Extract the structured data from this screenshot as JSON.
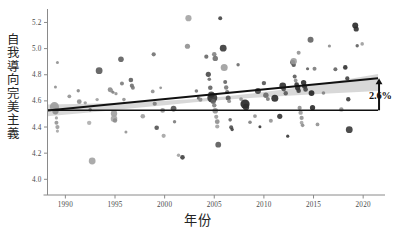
{
  "chart_data": {
    "type": "scatter",
    "title": "",
    "subtitle": "",
    "xlabel": "年份",
    "ylabel": "自我導向完美主義",
    "xlim": [
      1988.2,
      2022.2
    ],
    "ylim": [
      3.88,
      5.28
    ],
    "xticks": [
      1990,
      1995,
      2000,
      2005,
      2010,
      2015,
      2020
    ],
    "xticklabels": [
      "1990",
      "1995",
      "2000",
      "2005",
      "2010",
      "2015",
      "2020"
    ],
    "yticks": [
      4.0,
      4.2,
      4.4,
      4.6,
      4.8,
      5.0,
      5.2
    ],
    "yticklabels": [
      "4.0",
      "4.2",
      "4.4",
      "4.6",
      "4.8",
      "5.0",
      "5.2"
    ],
    "grid": false,
    "legend": null,
    "legend_position": "none",
    "annotations": [
      {
        "name": "change-annotation",
        "text": "2.6%",
        "x": 2021.6,
        "y_from": 4.528,
        "y_to": 4.773,
        "arrow": "up"
      }
    ],
    "reference_line": {
      "name": "baseline-1989",
      "type": "horizontal",
      "y": 4.528,
      "x_start": 1988.2,
      "x_end": 2021.5,
      "color": "#111111"
    },
    "trend_line": {
      "name": "linear-regression",
      "color": "#111111",
      "x_start": 1988.2,
      "x_end": 2021.5,
      "y_start": 4.527,
      "y_end": 4.773,
      "slope_per_year": 0.00739,
      "total_change_pct": 2.6
    },
    "confidence_band": {
      "name": "95-percent-ci",
      "color": "#c9c9c9",
      "opacity": 0.72,
      "x": [
        1988.2,
        1991,
        1994,
        1997,
        2000,
        2003,
        2006,
        2009,
        2012,
        2015,
        2018,
        2021.5
      ],
      "lower": [
        4.483,
        4.502,
        4.523,
        4.545,
        4.567,
        4.589,
        4.608,
        4.624,
        4.637,
        4.65,
        4.662,
        4.676
      ],
      "upper": [
        4.572,
        4.576,
        4.582,
        4.59,
        4.601,
        4.615,
        4.634,
        4.658,
        4.688,
        4.722,
        4.76,
        4.806
      ]
    },
    "point_style": {
      "marker": "circle",
      "size_range_px": [
        1.3,
        5.4
      ],
      "color_light": "#b4b4b4",
      "color_mid": "#6e6e6e",
      "color_dark": "#1f1f1f",
      "size_encodes": "sample-size",
      "color_encodes": "sample-weight"
    },
    "points": [
      {
        "x": 1989.2,
        "y": 4.893,
        "r": 1.5,
        "c": "#8c8c8c"
      },
      {
        "x": 1989.0,
        "y": 4.706,
        "r": 1.5,
        "c": "#8c8c8c"
      },
      {
        "x": 1988.9,
        "y": 4.556,
        "r": 4.6,
        "c": "#9a9a9a"
      },
      {
        "x": 1989.0,
        "y": 4.52,
        "r": 3.1,
        "c": "#8a8a8a"
      },
      {
        "x": 1989.1,
        "y": 4.47,
        "r": 1.6,
        "c": "#9c9c9c"
      },
      {
        "x": 1989.1,
        "y": 4.432,
        "r": 2.0,
        "c": "#8f8f8f"
      },
      {
        "x": 1989.2,
        "y": 4.4,
        "r": 2.1,
        "c": "#9a9a9a"
      },
      {
        "x": 1989.2,
        "y": 4.369,
        "r": 1.6,
        "c": "#a4a4a4"
      },
      {
        "x": 1990.4,
        "y": 4.635,
        "r": 1.9,
        "c": "#909090"
      },
      {
        "x": 1991.3,
        "y": 4.677,
        "r": 1.7,
        "c": "#848484"
      },
      {
        "x": 1991.4,
        "y": 4.594,
        "r": 2.4,
        "c": "#8b8b8b"
      },
      {
        "x": 1992.0,
        "y": 4.585,
        "r": 1.7,
        "c": "#979797"
      },
      {
        "x": 1992.5,
        "y": 4.532,
        "r": 1.8,
        "c": "#6f6f6f"
      },
      {
        "x": 1992.4,
        "y": 4.432,
        "r": 2.2,
        "c": "#ababab"
      },
      {
        "x": 1992.7,
        "y": 4.14,
        "r": 3.4,
        "c": "#9f9f9f"
      },
      {
        "x": 1993.4,
        "y": 4.831,
        "r": 3.4,
        "c": "#555555"
      },
      {
        "x": 1993.2,
        "y": 4.61,
        "r": 1.7,
        "c": "#9b9b9b"
      },
      {
        "x": 1994.5,
        "y": 4.686,
        "r": 2.4,
        "c": "#888888"
      },
      {
        "x": 1994.6,
        "y": 4.68,
        "r": 2.1,
        "c": "#959595"
      },
      {
        "x": 1994.8,
        "y": 4.666,
        "r": 1.6,
        "c": "#7b7b7b"
      },
      {
        "x": 1995.1,
        "y": 4.655,
        "r": 1.6,
        "c": "#8e8e8e"
      },
      {
        "x": 1994.9,
        "y": 4.503,
        "r": 3.2,
        "c": "#9d9d9d"
      },
      {
        "x": 1994.9,
        "y": 4.463,
        "r": 3.3,
        "c": "#a3a3a3"
      },
      {
        "x": 1995.0,
        "y": 4.45,
        "r": 2.2,
        "c": "#8b8b8b"
      },
      {
        "x": 1995.6,
        "y": 4.918,
        "r": 2.8,
        "c": "#5b5b5b"
      },
      {
        "x": 1995.7,
        "y": 4.733,
        "r": 2.0,
        "c": "#787878"
      },
      {
        "x": 1995.9,
        "y": 4.61,
        "r": 1.8,
        "c": "#8e8e8e"
      },
      {
        "x": 1996.1,
        "y": 4.362,
        "r": 1.5,
        "c": "#909090"
      },
      {
        "x": 1996.6,
        "y": 4.76,
        "r": 2.3,
        "c": "#5a5a5a"
      },
      {
        "x": 1996.7,
        "y": 4.716,
        "r": 2.1,
        "c": "#6c6c6c"
      },
      {
        "x": 1996.8,
        "y": 4.7,
        "r": 2.0,
        "c": "#747474"
      },
      {
        "x": 1997.8,
        "y": 4.483,
        "r": 2.3,
        "c": "#9b9b9b"
      },
      {
        "x": 1998.9,
        "y": 4.956,
        "r": 2.1,
        "c": "#6d6d6d"
      },
      {
        "x": 1998.8,
        "y": 4.672,
        "r": 1.9,
        "c": "#8b8b8b"
      },
      {
        "x": 1999.0,
        "y": 4.578,
        "r": 2.1,
        "c": "#797979"
      },
      {
        "x": 1999.2,
        "y": 4.395,
        "r": 2.3,
        "c": "#4e4e4e"
      },
      {
        "x": 1999.6,
        "y": 4.7,
        "r": 1.4,
        "c": "#8d8d8d"
      },
      {
        "x": 1999.8,
        "y": 4.527,
        "r": 2.4,
        "c": "#929292"
      },
      {
        "x": 1999.9,
        "y": 4.333,
        "r": 2.1,
        "c": "#a2a2a2"
      },
      {
        "x": 2000.9,
        "y": 4.541,
        "r": 2.9,
        "c": "#4d4d4d"
      },
      {
        "x": 2001.0,
        "y": 4.44,
        "r": 1.7,
        "c": "#787878"
      },
      {
        "x": 2001.4,
        "y": 4.184,
        "r": 1.7,
        "c": "#9e9e9e"
      },
      {
        "x": 2001.8,
        "y": 4.168,
        "r": 2.3,
        "c": "#3a3a3a"
      },
      {
        "x": 2002.3,
        "y": 5.018,
        "r": 2.6,
        "c": "#8d8d8d"
      },
      {
        "x": 2002.4,
        "y": 5.233,
        "r": 3.1,
        "c": "#a0a0a0"
      },
      {
        "x": 2003.2,
        "y": 4.676,
        "r": 1.8,
        "c": "#707070"
      },
      {
        "x": 2003.4,
        "y": 4.622,
        "r": 1.6,
        "c": "#5a5a5a"
      },
      {
        "x": 2003.6,
        "y": 4.609,
        "r": 2.1,
        "c": "#888888"
      },
      {
        "x": 2004.2,
        "y": 4.938,
        "r": 2.1,
        "c": "#636363"
      },
      {
        "x": 2004.4,
        "y": 4.803,
        "r": 2.6,
        "c": "#444444"
      },
      {
        "x": 2004.5,
        "y": 4.766,
        "r": 1.8,
        "c": "#6a6a6a"
      },
      {
        "x": 2004.6,
        "y": 4.701,
        "r": 2.3,
        "c": "#5f5f5f"
      },
      {
        "x": 2004.7,
        "y": 4.648,
        "r": 3.2,
        "c": "#3d3d3d"
      },
      {
        "x": 2004.8,
        "y": 4.624,
        "r": 5.0,
        "c": "#2d2d2d"
      },
      {
        "x": 2004.9,
        "y": 4.595,
        "r": 2.5,
        "c": "#636363"
      },
      {
        "x": 2005.0,
        "y": 4.566,
        "r": 2.2,
        "c": "#7c7c7c"
      },
      {
        "x": 2005.1,
        "y": 4.524,
        "r": 2.8,
        "c": "#8f8f8f"
      },
      {
        "x": 2005.2,
        "y": 4.478,
        "r": 2.1,
        "c": "#9a9a9a"
      },
      {
        "x": 2005.3,
        "y": 4.441,
        "r": 2.4,
        "c": "#8a8a8a"
      },
      {
        "x": 2005.3,
        "y": 4.404,
        "r": 2.1,
        "c": "#9f9f9f"
      },
      {
        "x": 2005.4,
        "y": 4.265,
        "r": 2.9,
        "c": "#555555"
      },
      {
        "x": 2005.0,
        "y": 4.957,
        "r": 2.3,
        "c": "#7e7e7e"
      },
      {
        "x": 2005.1,
        "y": 4.925,
        "r": 2.7,
        "c": "#6a6a6a"
      },
      {
        "x": 2005.6,
        "y": 5.232,
        "r": 2.0,
        "c": "#3f3f3f"
      },
      {
        "x": 2005.9,
        "y": 5.003,
        "r": 3.4,
        "c": "#333333"
      },
      {
        "x": 2006.0,
        "y": 4.855,
        "r": 3.5,
        "c": "#9b9b9b"
      },
      {
        "x": 2006.1,
        "y": 4.745,
        "r": 2.0,
        "c": "#5f5f5f"
      },
      {
        "x": 2006.2,
        "y": 4.702,
        "r": 2.2,
        "c": "#747474"
      },
      {
        "x": 2006.3,
        "y": 4.668,
        "r": 2.1,
        "c": "#666666"
      },
      {
        "x": 2006.4,
        "y": 4.622,
        "r": 2.5,
        "c": "#4c4c4c"
      },
      {
        "x": 2006.5,
        "y": 4.598,
        "r": 1.9,
        "c": "#8b8b8b"
      },
      {
        "x": 2006.6,
        "y": 4.455,
        "r": 1.8,
        "c": "#626262"
      },
      {
        "x": 2006.7,
        "y": 4.398,
        "r": 2.0,
        "c": "#4a4a4a"
      },
      {
        "x": 2006.8,
        "y": 4.381,
        "r": 1.7,
        "c": "#3e3e3e"
      },
      {
        "x": 2007.4,
        "y": 4.876,
        "r": 1.7,
        "c": "#676767"
      },
      {
        "x": 2007.7,
        "y": 4.614,
        "r": 1.9,
        "c": "#8d8d8d"
      },
      {
        "x": 2008.1,
        "y": 4.576,
        "r": 4.6,
        "c": "#1f1f1f"
      },
      {
        "x": 2008.2,
        "y": 4.554,
        "r": 3.2,
        "c": "#2c2c2c"
      },
      {
        "x": 2008.6,
        "y": 4.437,
        "r": 1.8,
        "c": "#7b7b7b"
      },
      {
        "x": 2009.1,
        "y": 4.484,
        "r": 1.9,
        "c": "#909090"
      },
      {
        "x": 2009.4,
        "y": 4.676,
        "r": 3.0,
        "c": "#3a3a3a"
      },
      {
        "x": 2009.6,
        "y": 4.403,
        "r": 1.5,
        "c": "#2f2f2f"
      },
      {
        "x": 2010.0,
        "y": 4.736,
        "r": 2.2,
        "c": "#505050"
      },
      {
        "x": 2010.2,
        "y": 4.643,
        "r": 2.7,
        "c": "#666666"
      },
      {
        "x": 2010.4,
        "y": 4.614,
        "r": 2.0,
        "c": "#7a7a7a"
      },
      {
        "x": 2010.7,
        "y": 4.448,
        "r": 2.0,
        "c": "#8f8f8f"
      },
      {
        "x": 2011.1,
        "y": 4.62,
        "r": 3.5,
        "c": "#222222"
      },
      {
        "x": 2011.6,
        "y": 4.482,
        "r": 2.6,
        "c": "#2e2e2e"
      },
      {
        "x": 2011.9,
        "y": 4.714,
        "r": 3.4,
        "c": "#2a2a2a"
      },
      {
        "x": 2012.0,
        "y": 4.69,
        "r": 2.3,
        "c": "#4b4b4b"
      },
      {
        "x": 2012.2,
        "y": 4.658,
        "r": 2.2,
        "c": "#555555"
      },
      {
        "x": 2012.4,
        "y": 4.33,
        "r": 1.6,
        "c": "#303030"
      },
      {
        "x": 2012.9,
        "y": 4.895,
        "r": 2.5,
        "c": "#3e3e3e"
      },
      {
        "x": 2013.0,
        "y": 4.876,
        "r": 2.2,
        "c": "#4a4a4a"
      },
      {
        "x": 2013.1,
        "y": 4.786,
        "r": 2.0,
        "c": "#555555"
      },
      {
        "x": 2013.2,
        "y": 4.756,
        "r": 1.9,
        "c": "#8c8c8c"
      },
      {
        "x": 2013.3,
        "y": 4.724,
        "r": 2.4,
        "c": "#2b2b2b"
      },
      {
        "x": 2013.4,
        "y": 4.7,
        "r": 2.6,
        "c": "#242424"
      },
      {
        "x": 2013.5,
        "y": 4.678,
        "r": 2.3,
        "c": "#353535"
      },
      {
        "x": 2013.6,
        "y": 4.546,
        "r": 2.1,
        "c": "#8b8b8b"
      },
      {
        "x": 2013.7,
        "y": 4.51,
        "r": 2.2,
        "c": "#9a9a9a"
      },
      {
        "x": 2013.8,
        "y": 4.47,
        "r": 2.1,
        "c": "#8f8f8f"
      },
      {
        "x": 2013.8,
        "y": 4.433,
        "r": 1.9,
        "c": "#a0a0a0"
      },
      {
        "x": 2013.9,
        "y": 4.413,
        "r": 1.8,
        "c": "#8a8a8a"
      },
      {
        "x": 2013.0,
        "y": 4.903,
        "r": 3.2,
        "c": "#9c9c9c"
      },
      {
        "x": 2013.5,
        "y": 4.968,
        "r": 2.0,
        "c": "#8e8e8e"
      },
      {
        "x": 2014.0,
        "y": 4.74,
        "r": 2.7,
        "c": "#262626"
      },
      {
        "x": 2014.1,
        "y": 4.712,
        "r": 2.5,
        "c": "#2f2f2f"
      },
      {
        "x": 2014.2,
        "y": 4.688,
        "r": 2.3,
        "c": "#3c3c3c"
      },
      {
        "x": 2014.4,
        "y": 4.846,
        "r": 1.6,
        "c": "#5c5c5c"
      },
      {
        "x": 2014.7,
        "y": 5.068,
        "r": 3.0,
        "c": "#5e5e5e"
      },
      {
        "x": 2014.8,
        "y": 4.66,
        "r": 2.9,
        "c": "#1e1e1e"
      },
      {
        "x": 2014.9,
        "y": 4.548,
        "r": 2.6,
        "c": "#242424"
      },
      {
        "x": 2015.1,
        "y": 4.845,
        "r": 2.0,
        "c": "#777777"
      },
      {
        "x": 2015.4,
        "y": 4.42,
        "r": 1.9,
        "c": "#909090"
      },
      {
        "x": 2016.0,
        "y": 4.66,
        "r": 1.8,
        "c": "#7f7f7f"
      },
      {
        "x": 2016.6,
        "y": 5.02,
        "r": 1.6,
        "c": "#8a8a8a"
      },
      {
        "x": 2017.2,
        "y": 4.842,
        "r": 2.0,
        "c": "#5d5d5d"
      },
      {
        "x": 2017.8,
        "y": 4.535,
        "r": 2.2,
        "c": "#8d8d8d"
      },
      {
        "x": 2018.2,
        "y": 4.856,
        "r": 2.3,
        "c": "#2a2a2a"
      },
      {
        "x": 2018.4,
        "y": 4.772,
        "r": 2.1,
        "c": "#3b3b3b"
      },
      {
        "x": 2018.5,
        "y": 4.612,
        "r": 2.2,
        "c": "#353535"
      },
      {
        "x": 2018.6,
        "y": 4.38,
        "r": 3.4,
        "c": "#343434"
      },
      {
        "x": 2019.2,
        "y": 5.177,
        "r": 3.0,
        "c": "#232323"
      },
      {
        "x": 2019.3,
        "y": 5.15,
        "r": 2.6,
        "c": "#2b2b2b"
      },
      {
        "x": 2019.4,
        "y": 5.022,
        "r": 1.7,
        "c": "#5b5b5b"
      },
      {
        "x": 2019.9,
        "y": 5.036,
        "r": 1.8,
        "c": "#9a9a9a"
      }
    ]
  }
}
